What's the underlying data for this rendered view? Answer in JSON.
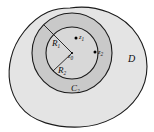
{
  "figure": {
    "name": "annulus-in-domain-diagram",
    "background": "#ffffff"
  },
  "colors": {
    "domain_fill": "#e4e4e4",
    "annulus_fill": "#c9c9c9",
    "inner_disk_fill": "#d8d8d8",
    "stroke": "#1a1a1a",
    "point": "#000000",
    "label": "#0d0d0d"
  },
  "labels": {
    "domain": "D",
    "radius_outer": "R",
    "radius_outer_sub": "1",
    "radius_inner": "R",
    "radius_inner_sub": "2",
    "circle_outer": "C",
    "circle_outer_sub": "2",
    "center_point": "z",
    "center_point_sub": "0",
    "point_one": "z",
    "point_one_sub": "1",
    "point_two": "z",
    "point_two_sub": "2"
  },
  "geometry": {
    "center": {
      "x": 72,
      "y": 53
    },
    "radius_outer_px": 40,
    "radius_inner_px": 26,
    "points": [
      {
        "name": "z0",
        "x": 72,
        "y": 53
      },
      {
        "name": "z1",
        "x": 77,
        "y": 39
      },
      {
        "name": "z2",
        "x": 95,
        "y": 52
      }
    ]
  }
}
